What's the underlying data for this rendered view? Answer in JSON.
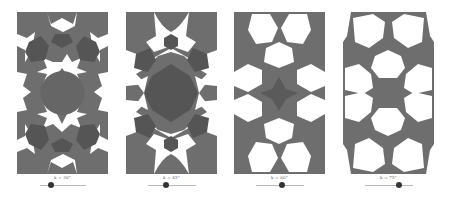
{
  "figure": {
    "background": "#ffffff",
    "tile_color": "#6e6e6e",
    "dark_poly_color": "#555555",
    "gap_color": "#ffffff"
  },
  "panels": [
    {
      "label": "k = 30°",
      "slider_value": 30,
      "handle_left": 34,
      "track_left": 23,
      "track_width": 46
    },
    {
      "label": "k = 45°",
      "slider_value": 45,
      "handle_left": 40,
      "track_left": 22,
      "track_width": 48
    },
    {
      "label": "k = 60°",
      "slider_value": 60,
      "handle_left": 48,
      "track_left": 22,
      "track_width": 48
    },
    {
      "label": "k = 75°",
      "slider_value": 75,
      "handle_left": 56,
      "track_left": 22,
      "track_width": 48
    }
  ]
}
